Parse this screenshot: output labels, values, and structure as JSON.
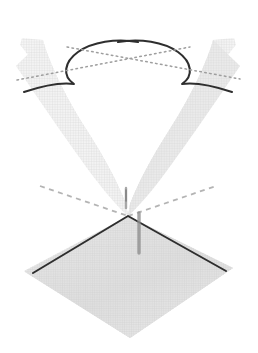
{
  "figure": {
    "title": "Conic section: hyperbola formed by a plane cutting a double cone",
    "type": "geometry-diagram",
    "canvas": {
      "width": 258,
      "height": 353,
      "background": "#ffffff"
    },
    "colors": {
      "background": "#ffffff",
      "curve_stroke": "#2e2e2e",
      "asymptote_dotted": "#9a9a9a",
      "plane_edge_dark": "#2e2e2e",
      "plane_edge_dashed": "#b2b2b2",
      "surface_light": "#f2f2f2",
      "surface_mid": "#e4e4e4",
      "surface_shadow": "#d2d2d2",
      "mesh_line": "#d8d8d8",
      "axis_marker": "#8c8c8c"
    },
    "elements": [
      {
        "name": "upper-nappe-left-sheet",
        "kind": "surface",
        "label": "Left upper cone sheet"
      },
      {
        "name": "upper-nappe-right-sheet",
        "kind": "surface",
        "label": "Right upper cone sheet"
      },
      {
        "name": "lower-nappe-surface",
        "kind": "surface",
        "label": "Lower cone nappe"
      },
      {
        "name": "cutting-plane",
        "kind": "plane",
        "label": "Cutting plane (diamond)"
      },
      {
        "name": "hyperbola-branch-left",
        "kind": "curve",
        "label": "Left hyperbola branch"
      },
      {
        "name": "hyperbola-branch-right",
        "kind": "curve",
        "label": "Right hyperbola branch"
      },
      {
        "name": "asymptote-dotted-down-right",
        "kind": "guide",
        "label": "Dotted asymptote descending right"
      },
      {
        "name": "asymptote-dotted-up-right",
        "kind": "guide",
        "label": "Dotted asymptote ascending right"
      },
      {
        "name": "plane-edge-dashed-far",
        "kind": "guide",
        "label": "Far (hidden) plane edge, dashed"
      },
      {
        "name": "plane-edge-solid-near",
        "kind": "guide",
        "label": "Near plane edge, solid"
      },
      {
        "name": "vertical-axis-marker",
        "kind": "marker",
        "label": "Cone axis tick"
      }
    ],
    "geometry": {
      "apex": {
        "x": 128,
        "y": 216
      },
      "asymptote_crossing": {
        "x": 128,
        "y": 62
      },
      "hyperbola_left_vertex": {
        "x": 72,
        "y": 60
      },
      "hyperbola_right_vertex": {
        "x": 185,
        "y": 60
      },
      "plane_diamond": {
        "left": {
          "x": 25,
          "y": 272
        },
        "right": {
          "x": 233,
          "y": 268
        },
        "top": {
          "x": 128,
          "y": 216
        },
        "bottom": {
          "x": 130,
          "y": 338
        }
      },
      "v_gap_apex": {
        "x": 128,
        "y": 163
      }
    }
  }
}
